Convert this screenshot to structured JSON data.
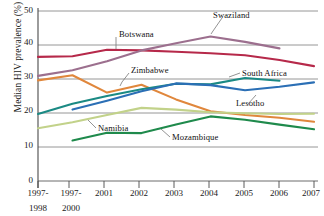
{
  "chart_data": {
    "type": "line",
    "title": "",
    "xlabel": "",
    "ylabel": "Median HIV prevalence (%)",
    "ylim": [
      0,
      50
    ],
    "yticks": [
      0,
      10,
      20,
      30,
      40,
      50
    ],
    "grid": true,
    "legend_position": "inline-annotations",
    "categories": [
      "1997-1998",
      "1997-2000",
      "2001",
      "2002",
      "2003",
      "2004",
      "2005",
      "2006",
      "2007"
    ],
    "category_lines": [
      [
        "1997-",
        "1998"
      ],
      [
        "1997-",
        "2000"
      ],
      [
        "2001",
        ""
      ],
      [
        "2002",
        ""
      ],
      [
        "2003",
        ""
      ],
      [
        "2004",
        ""
      ],
      [
        "2005",
        ""
      ],
      [
        "2006",
        ""
      ],
      [
        "2007",
        ""
      ]
    ],
    "series": [
      {
        "name": "Botswana",
        "color": "#b6294a",
        "x": [
          "1997-1998",
          "1997-2000",
          "2001",
          "2002",
          "2003",
          "2004",
          "2005",
          "2006",
          "2007"
        ],
        "values": [
          36.5,
          36.7,
          38.6,
          38.4,
          38.0,
          37.6,
          37.0,
          35.6,
          33.8
        ]
      },
      {
        "name": "Swaziland",
        "color": "#9c6f8e",
        "x": [
          "1997-1998",
          "1997-2000",
          "2001",
          "2002",
          "2003",
          "2004",
          "2005",
          "2006"
        ],
        "values": [
          30.9,
          32.6,
          35.2,
          38.4,
          40.5,
          42.5,
          40.9,
          39.0
        ]
      },
      {
        "name": "Zimbabwe",
        "color": "#e0873c",
        "x": [
          "1997-1998",
          "1997-2000",
          "2001",
          "2002",
          "2003",
          "2004",
          "2005",
          "2006",
          "2007"
        ],
        "values": [
          29.6,
          31.1,
          26.0,
          28.3,
          24.0,
          20.5,
          19.4,
          18.6,
          17.4
        ]
      },
      {
        "name": "South Africa",
        "color": "#1b8a84",
        "x": [
          "1997-1998",
          "1997-2000",
          "2001",
          "2002",
          "2003",
          "2004",
          "2005",
          "2006"
        ],
        "values": [
          19.7,
          22.7,
          25.0,
          27.0,
          28.6,
          28.4,
          30.3,
          29.5
        ]
      },
      {
        "name": "Lesotho",
        "color": "#2b6fb5",
        "x": [
          "1997-2000",
          "2001",
          "2002",
          "2003",
          "2004",
          "2005",
          "2006",
          "2007"
        ],
        "values": [
          21.0,
          23.6,
          26.4,
          28.7,
          28.2,
          26.7,
          27.7,
          29.0
        ]
      },
      {
        "name": "Namibia",
        "color": "#c2d28a",
        "x": [
          "1997-1998",
          "1997-2000",
          "2001",
          "2002",
          "2003",
          "2004",
          "2005",
          "2006",
          "2007"
        ],
        "values": [
          15.5,
          17.3,
          19.4,
          21.5,
          21.0,
          20.2,
          19.9,
          19.7,
          19.8
        ]
      },
      {
        "name": "Mozambique",
        "color": "#1f8a4c",
        "x": [
          "1997-2000",
          "2001",
          "2002",
          "2003",
          "2004",
          "2005",
          "2006",
          "2007"
        ],
        "values": [
          11.9,
          14.2,
          14.1,
          16.6,
          19.0,
          18.0,
          16.6,
          15.2
        ]
      }
    ],
    "annotations": [
      {
        "label": "Botswana",
        "series": "Botswana"
      },
      {
        "label": "Swaziland",
        "series": "Swaziland"
      },
      {
        "label": "Zimbabwe",
        "series": "Zimbabwe"
      },
      {
        "label": "South Africa",
        "series": "South Africa"
      },
      {
        "label": "Lesotho",
        "series": "Lesotho"
      },
      {
        "label": "Namibia",
        "series": "Namibia"
      },
      {
        "label": "Mozambique",
        "series": "Mozambique"
      }
    ]
  }
}
